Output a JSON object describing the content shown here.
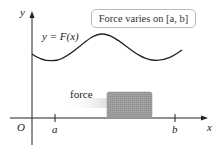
{
  "diagram": {
    "callout": "Force varies on [a, b]",
    "curve_label": "y = F(x)",
    "force_label": "force",
    "axes": {
      "x_label": "x",
      "y_label": "y",
      "origin_label": "O"
    },
    "ticks": {
      "a": "a",
      "b": "b"
    },
    "colors": {
      "curve": "#222222",
      "block": "#9a9a9a",
      "axis": "#222222",
      "callout_border": "#bbbbbb"
    }
  }
}
